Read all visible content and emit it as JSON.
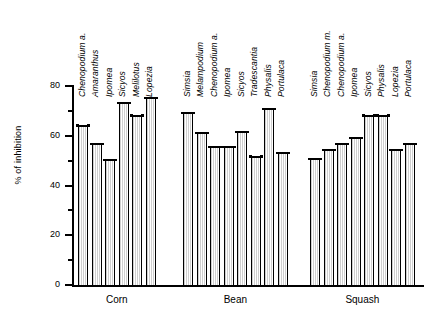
{
  "chart_data": {
    "type": "bar",
    "title": "",
    "xlabel": "",
    "ylabel": "% of inhibition",
    "ylim": [
      0,
      80
    ],
    "yticks": [
      0,
      20,
      40,
      60,
      80
    ],
    "yminor": [
      10,
      30,
      50,
      70
    ],
    "grid": false,
    "legend": "none",
    "groups": [
      {
        "name": "Corn",
        "categories": [
          "Chenopodium a.",
          "Amaranthus",
          "Ipomea",
          "Sicyos",
          "Melilotus",
          "Lopezia"
        ],
        "values": [
          64.5,
          57.0,
          50.5,
          73.5,
          68.5,
          75.5
        ]
      },
      {
        "name": "Bean",
        "categories": [
          "Simsia",
          "Melampodium",
          "Chenopodium a.",
          "Ipomea",
          "Sicyos",
          "Tradescantia",
          "Physalis",
          "Portulaca"
        ],
        "values": [
          69.5,
          61.5,
          56.0,
          56.0,
          62.0,
          52.0,
          71.0,
          53.5
        ]
      },
      {
        "name": "Squash",
        "categories": [
          "Simsia",
          "Chenopodium m.",
          "Chenopodium a.",
          "Ipomea",
          "Sicyos",
          "Physalis",
          "Lopezia",
          "Portulaca"
        ],
        "values": [
          51.0,
          54.5,
          57.0,
          59.5,
          68.5,
          68.5,
          54.5,
          57.0
        ]
      }
    ]
  },
  "colors": {
    "axis": "#000000",
    "bar_outline": "#000000",
    "bar_fill": "#ffffff",
    "bar_hatch": "#cfcfcf",
    "background": "#ffffff"
  }
}
